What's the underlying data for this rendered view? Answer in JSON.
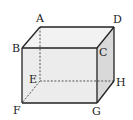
{
  "diagram": {
    "colors": {
      "edge": "#222222",
      "hidden_edge": "#444444",
      "front_face": "#ececec",
      "top_face": "#f2f2f2",
      "right_face": "#d9d9d9",
      "background": "#ffffff"
    },
    "vertices": [
      {
        "name": "A",
        "label": "A"
      },
      {
        "name": "B",
        "label": "B"
      },
      {
        "name": "C",
        "label": "C"
      },
      {
        "name": "D",
        "label": "D"
      },
      {
        "name": "E",
        "label": "E"
      },
      {
        "name": "F",
        "label": "F"
      },
      {
        "name": "G",
        "label": "G"
      },
      {
        "name": "H",
        "label": "H"
      }
    ],
    "visible_edges": [
      "AB",
      "AD",
      "BC",
      "CD",
      "BF",
      "CG",
      "DH",
      "FG",
      "GH"
    ],
    "hidden_edges": [
      "AE",
      "EF",
      "EH"
    ]
  }
}
